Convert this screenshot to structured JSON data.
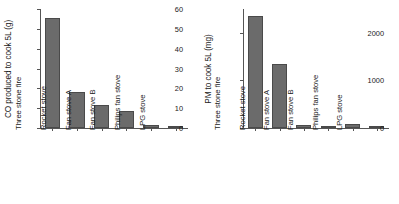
{
  "chart_data": [
    {
      "type": "bar",
      "panel": "left",
      "title": "",
      "xlabel": "",
      "ylabel": "CO produced to cook 5L (g)",
      "categories": [
        "Three stone fire",
        "Rocket stove",
        "Fan stove A",
        "Fan stove B",
        "Philips fan stove",
        "LPG stove"
      ],
      "values": [
        55.5,
        18.0,
        11.5,
        8.5,
        1.5,
        0.6
      ],
      "ylim": [
        0,
        60
      ],
      "yticks": [
        0,
        10,
        20,
        30,
        40,
        50,
        60
      ],
      "ytick_labels": [
        "0",
        "10",
        "20",
        "30",
        "40",
        "50",
        "60"
      ],
      "grid": false,
      "legend": "none",
      "bar_color": "#6b6b6b"
    },
    {
      "type": "bar",
      "panel": "right",
      "title": "",
      "xlabel": "",
      "ylabel": "PM to cook 5L (mg)",
      "categories": [
        "Three stone fire",
        "Rocket stove",
        "Fan stove A",
        "Fan stove B",
        "Philips fan stove",
        "LPG stove"
      ],
      "values": [
        2350,
        1350,
        60,
        35,
        75,
        12
      ],
      "ylim": [
        0,
        2500
      ],
      "yticks": [
        0,
        1000,
        2000
      ],
      "ytick_labels": [
        "0",
        "1000",
        "2000"
      ],
      "grid": false,
      "legend": "none",
      "bar_color": "#6b6b6b"
    }
  ]
}
